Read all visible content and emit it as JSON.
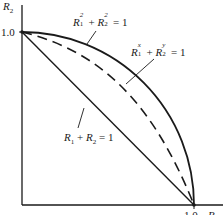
{
  "figure": {
    "y_axis_label": "R",
    "y_axis_label_sub": "2",
    "x_axis_label": "R",
    "x_axis_label_sub": "1",
    "y_tick_label": "1.0",
    "x_tick_label": "1.0",
    "colors": {
      "ink": "#1a1a1a",
      "background": "#ffffff"
    }
  },
  "curves": [
    {
      "name": "circle",
      "style": "solid",
      "label": {
        "a": "R",
        "a_sub": "1",
        "a_sup": "2",
        "plus": " + ",
        "b": "R",
        "b_sub": "2",
        "b_sup": "2",
        "rhs": " = 1"
      }
    },
    {
      "name": "generalized",
      "style": "dashed",
      "label": {
        "a": "R",
        "a_sub": "1",
        "a_sup": "x",
        "plus": " + ",
        "b": "R",
        "b_sub": "2",
        "b_sup": "y",
        "rhs": " = 1"
      }
    },
    {
      "name": "linear",
      "style": "solid",
      "label": {
        "a": "R",
        "a_sub": "1",
        "plus": " + ",
        "b": "R",
        "b_sub": "2",
        "rhs": " = 1"
      }
    }
  ]
}
